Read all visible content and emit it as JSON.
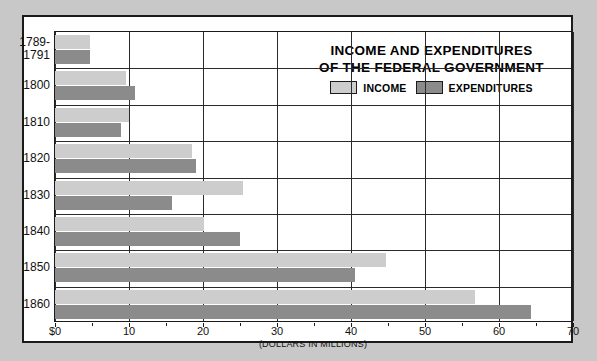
{
  "chart_data": {
    "type": "bar",
    "orientation": "horizontal",
    "title": "INCOME AND EXPENDITURES OF THE FEDERAL GOVERNMENT",
    "title_lines": [
      "INCOME AND EXPENDITURES",
      "OF THE FEDERAL GOVERNMENT"
    ],
    "xlabel": "(DOLLARS IN MILLIONS)",
    "ylabel": "",
    "xlim": [
      0,
      70
    ],
    "xticks": [
      0,
      10,
      20,
      30,
      40,
      50,
      60,
      70
    ],
    "xticklabels": [
      "$0",
      "10",
      "20",
      "30",
      "40",
      "50",
      "60",
      "70"
    ],
    "grid": true,
    "legend_position": "upper right",
    "categories": [
      "1789-\n1791",
      "1800",
      "1810",
      "1820",
      "1830",
      "1840",
      "1850",
      "1860"
    ],
    "series": [
      {
        "name": "INCOME",
        "color": "#cdcdcd",
        "values": [
          4.7,
          9.6,
          10.0,
          18.5,
          25.4,
          20.1,
          44.7,
          56.8
        ]
      },
      {
        "name": "EXPENDITURES",
        "color": "#8b8b8b",
        "values": [
          4.7,
          10.8,
          8.9,
          19.0,
          15.8,
          25.0,
          40.5,
          64.3
        ]
      }
    ]
  }
}
